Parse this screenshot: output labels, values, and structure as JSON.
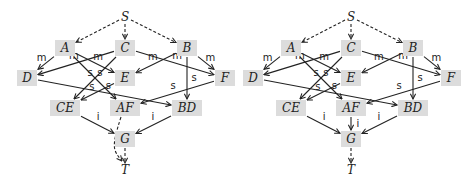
{
  "diagrams": [
    {
      "id": "left",
      "offset_x": 0,
      "nodes": [
        {
          "id": "S",
          "label": "S",
          "x": 125,
          "y": 17,
          "boxed": false
        },
        {
          "id": "A",
          "label": "A",
          "x": 65,
          "y": 48,
          "boxed": true
        },
        {
          "id": "C",
          "label": "C",
          "x": 125,
          "y": 48,
          "boxed": true
        },
        {
          "id": "B",
          "label": "B",
          "x": 187,
          "y": 48,
          "boxed": true
        },
        {
          "id": "D",
          "label": "D",
          "x": 27,
          "y": 78,
          "boxed": true
        },
        {
          "id": "E",
          "label": "E",
          "x": 125,
          "y": 78,
          "boxed": true
        },
        {
          "id": "F",
          "label": "F",
          "x": 225,
          "y": 78,
          "boxed": true
        },
        {
          "id": "CE",
          "label": "CE",
          "x": 65,
          "y": 108,
          "boxed": true
        },
        {
          "id": "AF",
          "label": "AF",
          "x": 125,
          "y": 108,
          "boxed": true
        },
        {
          "id": "BD",
          "label": "BD",
          "x": 187,
          "y": 108,
          "boxed": true
        },
        {
          "id": "G",
          "label": "G",
          "x": 125,
          "y": 139,
          "boxed": true
        },
        {
          "id": "T",
          "label": "T",
          "x": 125,
          "y": 170,
          "boxed": false
        }
      ],
      "edges": [
        {
          "from": "S",
          "to": "A",
          "style": "dashed",
          "label": ""
        },
        {
          "from": "S",
          "to": "C",
          "style": "dashed",
          "label": ""
        },
        {
          "from": "S",
          "to": "B",
          "style": "dashed",
          "label": ""
        },
        {
          "from": "A",
          "to": "D",
          "style": "solid",
          "label": "m"
        },
        {
          "from": "A",
          "to": "E",
          "style": "solid",
          "label": "m"
        },
        {
          "from": "A",
          "to": "AF",
          "style": "solid",
          "label": "s"
        },
        {
          "from": "C",
          "to": "D",
          "style": "solid",
          "label": "m"
        },
        {
          "from": "C",
          "to": "F",
          "style": "solid",
          "label": "m"
        },
        {
          "from": "C",
          "to": "CE",
          "style": "solid",
          "label": "s"
        },
        {
          "from": "B",
          "to": "E",
          "style": "solid",
          "label": "m"
        },
        {
          "from": "B",
          "to": "F",
          "style": "solid",
          "label": "m"
        },
        {
          "from": "B",
          "to": "BD",
          "style": "solid",
          "label": "s"
        },
        {
          "from": "D",
          "to": "BD",
          "style": "solid",
          "label": "s"
        },
        {
          "from": "E",
          "to": "CE",
          "style": "solid",
          "label": "s"
        },
        {
          "from": "F",
          "to": "AF",
          "style": "solid",
          "label": "s"
        },
        {
          "from": "CE",
          "to": "G",
          "style": "solid",
          "label": "i"
        },
        {
          "from": "BD",
          "to": "G",
          "style": "solid",
          "label": "i"
        },
        {
          "from": "AF",
          "to": "T",
          "style": "dashed-curve",
          "label": ""
        },
        {
          "from": "G",
          "to": "T",
          "style": "dashed",
          "label": ""
        }
      ]
    },
    {
      "id": "right",
      "offset_x": 226,
      "nodes": [
        {
          "id": "S",
          "label": "S",
          "x": 125,
          "y": 17,
          "boxed": false
        },
        {
          "id": "A",
          "label": "A",
          "x": 65,
          "y": 48,
          "boxed": true
        },
        {
          "id": "C",
          "label": "C",
          "x": 125,
          "y": 48,
          "boxed": true
        },
        {
          "id": "B",
          "label": "B",
          "x": 187,
          "y": 48,
          "boxed": true
        },
        {
          "id": "D",
          "label": "D",
          "x": 27,
          "y": 78,
          "boxed": true
        },
        {
          "id": "E",
          "label": "E",
          "x": 125,
          "y": 78,
          "boxed": true
        },
        {
          "id": "F",
          "label": "F",
          "x": 225,
          "y": 78,
          "boxed": true
        },
        {
          "id": "CE",
          "label": "CE",
          "x": 65,
          "y": 108,
          "boxed": true
        },
        {
          "id": "AF",
          "label": "AF",
          "x": 125,
          "y": 108,
          "boxed": true
        },
        {
          "id": "BD",
          "label": "BD",
          "x": 187,
          "y": 108,
          "boxed": true
        },
        {
          "id": "G",
          "label": "G",
          "x": 125,
          "y": 139,
          "boxed": true
        },
        {
          "id": "T",
          "label": "T",
          "x": 125,
          "y": 170,
          "boxed": false
        }
      ],
      "edges": [
        {
          "from": "S",
          "to": "A",
          "style": "dashed",
          "label": ""
        },
        {
          "from": "S",
          "to": "C",
          "style": "dashed",
          "label": ""
        },
        {
          "from": "S",
          "to": "B",
          "style": "dashed",
          "label": ""
        },
        {
          "from": "A",
          "to": "D",
          "style": "solid",
          "label": "m"
        },
        {
          "from": "A",
          "to": "E",
          "style": "solid",
          "label": "m"
        },
        {
          "from": "A",
          "to": "AF",
          "style": "solid",
          "label": "s"
        },
        {
          "from": "C",
          "to": "D",
          "style": "solid",
          "label": "m"
        },
        {
          "from": "C",
          "to": "F",
          "style": "solid",
          "label": "m"
        },
        {
          "from": "C",
          "to": "CE",
          "style": "solid",
          "label": "s"
        },
        {
          "from": "B",
          "to": "E",
          "style": "solid",
          "label": "m"
        },
        {
          "from": "B",
          "to": "F",
          "style": "solid",
          "label": "m"
        },
        {
          "from": "B",
          "to": "BD",
          "style": "solid",
          "label": "s"
        },
        {
          "from": "D",
          "to": "BD",
          "style": "solid",
          "label": "s"
        },
        {
          "from": "E",
          "to": "CE",
          "style": "solid",
          "label": "s"
        },
        {
          "from": "F",
          "to": "AF",
          "style": "solid",
          "label": "s"
        },
        {
          "from": "CE",
          "to": "G",
          "style": "solid",
          "label": "i"
        },
        {
          "from": "AF",
          "to": "G",
          "style": "solid",
          "label": "i"
        },
        {
          "from": "BD",
          "to": "G",
          "style": "solid",
          "label": "i"
        },
        {
          "from": "G",
          "to": "T",
          "style": "dashed",
          "label": ""
        }
      ]
    }
  ],
  "colors": {
    "node_fill": "#dcdcdc",
    "edge": "#222222",
    "background": "#ffffff"
  }
}
